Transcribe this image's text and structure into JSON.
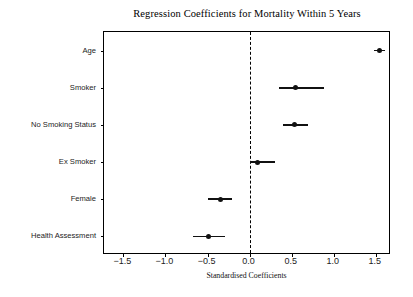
{
  "chart_data": {
    "type": "scatter",
    "title": "Regression Coefficients for Mortality Within 5 Years",
    "xlabel": "Standardised Coefficients",
    "ylabel": "",
    "orientation": "horizontal",
    "grid": false,
    "legend": null,
    "xlim": [
      -1.73,
      1.68
    ],
    "xticks": [
      -1.5,
      -1.0,
      -0.5,
      0.0,
      0.5,
      1.0,
      1.5
    ],
    "xticklabels": [
      "−1.5",
      "−1.0",
      "−0.5",
      "0.0",
      "0.5",
      "1.0",
      "1.5"
    ],
    "reference_line": {
      "x": 0.0,
      "style": "dashed",
      "color": "#000000"
    },
    "categories": [
      "Age",
      "Smoker",
      "No Smoking Status",
      "Ex Smoker",
      "Female",
      "Health Assessment"
    ],
    "values": [
      1.54,
      0.55,
      0.53,
      0.09,
      -0.34,
      -0.49
    ],
    "ci_low": [
      1.48,
      0.35,
      0.4,
      0.0,
      -0.49,
      -0.67
    ],
    "ci_high": [
      1.61,
      0.88,
      0.69,
      0.3,
      -0.21,
      -0.29
    ],
    "points": [
      {
        "label": "Age",
        "value": 1.54,
        "ci_low": 1.48,
        "ci_high": 1.61
      },
      {
        "label": "Smoker",
        "value": 0.55,
        "ci_low": 0.35,
        "ci_high": 0.88
      },
      {
        "label": "No Smoking Status",
        "value": 0.53,
        "ci_low": 0.4,
        "ci_high": 0.69
      },
      {
        "label": "Ex Smoker",
        "value": 0.09,
        "ci_low": 0.0,
        "ci_high": 0.3
      },
      {
        "label": "Female",
        "value": -0.34,
        "ci_low": -0.49,
        "ci_high": -0.21
      },
      {
        "label": "Health Assessment",
        "value": -0.49,
        "ci_low": -0.67,
        "ci_high": -0.29
      }
    ],
    "marker_color": "#111111",
    "errorbar_color": "#111111"
  }
}
